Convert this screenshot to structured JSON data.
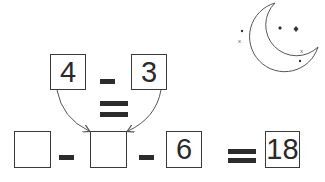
{
  "puzzle": {
    "top_row": {
      "left_value": "4",
      "operator": "-",
      "right_value": "3"
    },
    "middle_operator": "=",
    "bottom_row": {
      "box1_value": "",
      "op1": "-",
      "box2_value": "",
      "op2": "-",
      "box3_value": "6",
      "equals": "=",
      "result_value": "18"
    }
  },
  "decoration": {
    "icon": "crescent-moon-with-stars-icon"
  },
  "colors": {
    "ink": "#2c2c2c",
    "background": "#ffffff"
  }
}
